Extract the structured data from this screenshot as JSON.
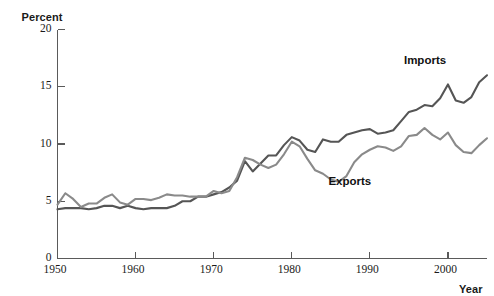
{
  "chart_data": {
    "type": "line",
    "title": "",
    "xlabel": "Year",
    "ylabel": "Percent",
    "xlim": [
      1950,
      2005
    ],
    "ylim": [
      0,
      20
    ],
    "grid": false,
    "legend_position": "inline-annotation",
    "xticks": [
      1950,
      1960,
      1970,
      1980,
      1990,
      2000
    ],
    "yticks": [
      0,
      5,
      10,
      15,
      20
    ],
    "x": [
      1950,
      1951,
      1952,
      1953,
      1954,
      1955,
      1956,
      1957,
      1958,
      1959,
      1960,
      1961,
      1962,
      1963,
      1964,
      1965,
      1966,
      1967,
      1968,
      1969,
      1970,
      1971,
      1972,
      1973,
      1974,
      1975,
      1976,
      1977,
      1978,
      1979,
      1980,
      1981,
      1982,
      1983,
      1984,
      1985,
      1986,
      1987,
      1988,
      1989,
      1990,
      1991,
      1992,
      1993,
      1994,
      1995,
      1996,
      1997,
      1998,
      1999,
      2000,
      2001,
      2002,
      2003,
      2004,
      2005
    ],
    "series": [
      {
        "name": "Imports",
        "color": "#555555",
        "label_x": 2000,
        "label_y": 17.2,
        "values": [
          4.3,
          4.4,
          4.4,
          4.4,
          4.3,
          4.4,
          4.6,
          4.6,
          4.4,
          4.6,
          4.4,
          4.3,
          4.4,
          4.4,
          4.4,
          4.6,
          5.0,
          5.0,
          5.4,
          5.4,
          5.6,
          5.8,
          6.2,
          6.8,
          8.5,
          7.6,
          8.3,
          9.0,
          9.0,
          9.9,
          10.6,
          10.3,
          9.5,
          9.3,
          10.4,
          10.2,
          10.2,
          10.8,
          11.0,
          11.2,
          11.3,
          10.9,
          11.0,
          11.2,
          12.0,
          12.8,
          13.0,
          13.4,
          13.3,
          14.0,
          15.2,
          13.8,
          13.6,
          14.1,
          15.4,
          16.0
        ]
      },
      {
        "name": "Exports",
        "color": "#8a8a8a",
        "label_x": 1987,
        "label_y": 6.6,
        "values": [
          4.7,
          5.7,
          5.2,
          4.5,
          4.8,
          4.8,
          5.3,
          5.6,
          4.9,
          4.7,
          5.2,
          5.2,
          5.1,
          5.3,
          5.6,
          5.5,
          5.5,
          5.4,
          5.4,
          5.4,
          5.9,
          5.7,
          5.9,
          7.1,
          8.8,
          8.6,
          8.2,
          7.9,
          8.2,
          9.1,
          10.2,
          9.8,
          8.7,
          7.7,
          7.4,
          6.9,
          6.7,
          7.2,
          8.4,
          9.1,
          9.5,
          9.8,
          9.7,
          9.4,
          9.8,
          10.7,
          10.8,
          11.4,
          10.8,
          10.4,
          11.0,
          9.9,
          9.3,
          9.2,
          9.9,
          10.5
        ]
      }
    ]
  },
  "axis": {
    "y_title": "Percent",
    "x_title": "Year",
    "ytick_labels": [
      "20",
      "15",
      "10",
      "5",
      "0"
    ],
    "xtick_labels": [
      "1950",
      "1960",
      "1970",
      "1980",
      "1990",
      "2000"
    ]
  },
  "annotations": {
    "imports_label": "Imports",
    "exports_label": "Exports"
  }
}
